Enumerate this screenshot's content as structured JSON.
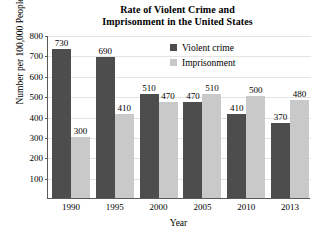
{
  "chart_data": {
    "type": "bar",
    "title": "Rate of Violent Crime and Imprisonment in the United States",
    "title_lines": [
      "Rate of Violent Crime and",
      "Imprisonment in the United States"
    ],
    "xlabel": "Year",
    "ylabel": "Number per 100,000 People",
    "categories": [
      "1990",
      "1995",
      "2000",
      "2005",
      "2010",
      "2013"
    ],
    "series": [
      {
        "name": "Violent crime",
        "color": "#4d4d4d",
        "values": [
          730,
          690,
          510,
          470,
          410,
          370
        ]
      },
      {
        "name": "Imprisonment",
        "color": "#c9c9c9",
        "values": [
          300,
          410,
          470,
          510,
          500,
          480
        ]
      }
    ],
    "ylim": [
      0,
      800
    ],
    "yticks": [
      100,
      200,
      300,
      400,
      500,
      600,
      700,
      800
    ],
    "ytick_labels": [
      "100",
      "200",
      "300",
      "400",
      "500",
      "600",
      "700",
      "800"
    ],
    "grid": true,
    "legend_position": "top-right",
    "data_labels": true
  }
}
